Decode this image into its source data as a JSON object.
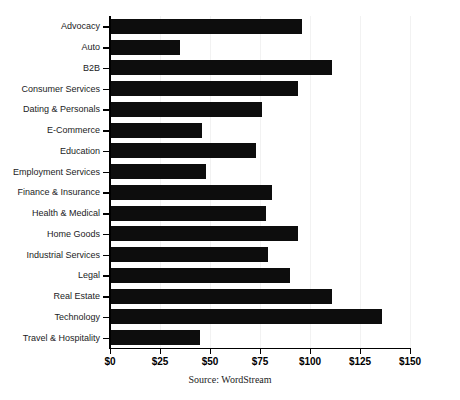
{
  "chart_data": {
    "type": "bar",
    "orientation": "horizontal",
    "title": "",
    "subtitle": "",
    "xlabel": "",
    "ylabel": "",
    "xlim": [
      0,
      150
    ],
    "xticks": [
      0,
      25,
      50,
      75,
      100,
      125,
      150
    ],
    "xtick_labels": [
      "$0",
      "$25",
      "$50",
      "$75",
      "$100",
      "$125",
      "$150"
    ],
    "grid": true,
    "legend": null,
    "bar_color": "#0d0d0d",
    "categories": [
      "Advocacy",
      "Auto",
      "B2B",
      "Consumer Services",
      "Dating & Personals",
      "E-Commerce",
      "Education",
      "Employment Services",
      "Finance & Insurance",
      "Health & Medical",
      "Home Goods",
      "Industrial Services",
      "Legal",
      "Real Estate",
      "Technology",
      "Travel & Hospitality"
    ],
    "values": [
      96,
      35,
      111,
      94,
      76,
      46,
      73,
      48,
      81,
      78,
      94,
      79,
      90,
      111,
      136,
      45
    ],
    "annotations": {
      "source": "Source: WordStream"
    }
  },
  "source_note": "Source: WordStream"
}
